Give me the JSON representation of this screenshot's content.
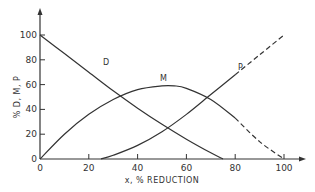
{
  "chart_data": {
    "type": "line",
    "title": "",
    "xlabel": "x, % REDUCTION",
    "ylabel": "% D, M, P",
    "xlim": [
      0,
      100
    ],
    "ylim": [
      0,
      100
    ],
    "grid": false,
    "legend": "inline curve labels",
    "x_ticks": [
      "0",
      "20",
      "40",
      "60",
      "80",
      "100"
    ],
    "y_ticks": [
      "0",
      "20",
      "40",
      "60",
      "80",
      "100"
    ],
    "series": [
      {
        "name": "D",
        "style": "solid",
        "x": [
          0,
          10,
          20,
          30,
          40,
          50,
          60,
          70,
          75
        ],
        "y": [
          100,
          85,
          70,
          55,
          41,
          28,
          16,
          5,
          0
        ]
      },
      {
        "name": "M",
        "style": "solid then dashed beyond ~80",
        "x": [
          0,
          10,
          20,
          30,
          40,
          50,
          55,
          60,
          70,
          80,
          90,
          100
        ],
        "y": [
          0,
          20,
          36,
          48,
          56,
          59,
          59,
          57,
          48,
          33,
          14,
          0
        ]
      },
      {
        "name": "P",
        "style": "solid then dashed beyond ~78",
        "x": [
          25,
          30,
          40,
          50,
          60,
          70,
          80,
          90,
          100
        ],
        "y": [
          0,
          3,
          11,
          22,
          36,
          52,
          68,
          84,
          100
        ]
      }
    ],
    "annotations": [
      "D",
      "M",
      "P"
    ]
  }
}
